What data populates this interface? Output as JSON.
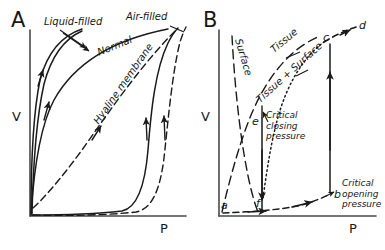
{
  "figure": {
    "type": "hand-drawn scientific line diagram",
    "background_color": "#ffffff",
    "ink_color": "#1a1a1a"
  },
  "panelA": {
    "letter": "A",
    "y_axis_label": "V",
    "x_axis_label": "P",
    "curves": [
      {
        "name": "liquid-filled",
        "label": "Liquid-filled",
        "style": "solid",
        "arrows": "inflation and deflation limbs, nearly superimposed"
      },
      {
        "name": "air-filled",
        "label": "Air-filled",
        "style": "solid",
        "arrows": "wide hysteresis loop"
      },
      {
        "name": "normal",
        "label": "Normal",
        "style": "solid",
        "arrows": "deflation limb of air-filled loop"
      },
      {
        "name": "hyaline-membrane",
        "label": "Hyaline membrane",
        "style": "dashed",
        "arrows": "shifted right, low compliance"
      }
    ]
  },
  "panelB": {
    "letter": "B",
    "y_axis_label": "V",
    "x_axis_label": "P",
    "curves": [
      {
        "name": "surface",
        "label": "Surface",
        "style": "long-dashed"
      },
      {
        "name": "tissue",
        "label": "Tissue",
        "style": "long-dashed"
      },
      {
        "name": "tissue-plus-surface",
        "label": "Tissue + Surface",
        "style": "dotted"
      }
    ],
    "points": [
      {
        "id": "a",
        "label": "a"
      },
      {
        "id": "b",
        "label": "b"
      },
      {
        "id": "c",
        "label": "c"
      },
      {
        "id": "d",
        "label": "d"
      },
      {
        "id": "e",
        "label": "e"
      },
      {
        "id": "f",
        "label": "f"
      }
    ],
    "annotations": [
      {
        "id": "critical-closing",
        "line1": "Critical",
        "line2": "closing",
        "line3": "pressure"
      },
      {
        "id": "critical-opening",
        "line1": "Critical",
        "line2": "opening",
        "line3": "pressure"
      }
    ]
  }
}
